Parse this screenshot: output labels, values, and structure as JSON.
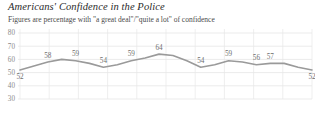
{
  "chart_data": {
    "type": "line",
    "title": "Americans' Confidence in the Police",
    "subtitle": "Figures are percentage with \"a great deal\"/\"quite a lot\" of confidence",
    "xlabel": "",
    "ylabel": "",
    "ylim": [
      30,
      80
    ],
    "yticks": [
      80,
      70,
      60,
      50,
      40,
      30
    ],
    "ytick_labels": [
      "80",
      "70",
      "60",
      "50",
      "40",
      "30"
    ],
    "grid": true,
    "legend": "none",
    "line_color": "#9a9a9a",
    "label_color": "#6e6e6e",
    "grid_color": "#e2e2e2",
    "x": [
      0,
      1,
      2,
      3,
      4,
      5,
      6,
      7,
      8,
      9,
      10,
      11,
      12,
      13,
      14,
      15,
      16,
      17,
      18,
      19,
      20,
      21
    ],
    "values": [
      52,
      55,
      58,
      60,
      59,
      57,
      54,
      56,
      59,
      61,
      64,
      63,
      59,
      54,
      56,
      59,
      58,
      56,
      57,
      57,
      54,
      52
    ],
    "labeled_points": [
      {
        "index": 0,
        "value": 52,
        "label": "52",
        "position": "below"
      },
      {
        "index": 2,
        "value": 58,
        "label": "58",
        "position": "above"
      },
      {
        "index": 4,
        "value": 59,
        "label": "59",
        "position": "above"
      },
      {
        "index": 6,
        "value": 54,
        "label": "54",
        "position": "above"
      },
      {
        "index": 8,
        "value": 59,
        "label": "59",
        "position": "above"
      },
      {
        "index": 10,
        "value": 64,
        "label": "64",
        "position": "above"
      },
      {
        "index": 13,
        "value": 54,
        "label": "54",
        "position": "above"
      },
      {
        "index": 15,
        "value": 59,
        "label": "59",
        "position": "above"
      },
      {
        "index": 17,
        "value": 56,
        "label": "56",
        "position": "above"
      },
      {
        "index": 18,
        "value": 57,
        "label": "57",
        "position": "above"
      },
      {
        "index": 21,
        "value": 52,
        "label": "52",
        "position": "below"
      }
    ]
  }
}
